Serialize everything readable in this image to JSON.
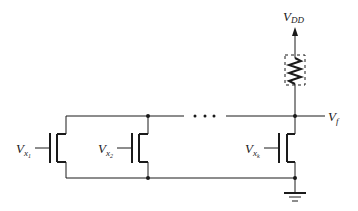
{
  "diagram": {
    "type": "circuit-schematic",
    "supply": {
      "label": "V",
      "sub": "DD"
    },
    "output": {
      "label": "V",
      "sub": "f"
    },
    "ellipsis": "...",
    "transistors": [
      {
        "label": "V",
        "sub": "x",
        "subsub": "1"
      },
      {
        "label": "V",
        "sub": "x",
        "subsub": "2"
      },
      {
        "label": "V",
        "sub": "x",
        "subsub": "k"
      }
    ],
    "load": "resistor (dashed box)",
    "ground": "ground-symbol",
    "colors": {
      "line": "#1a1a1a",
      "background": "#ffffff"
    }
  }
}
